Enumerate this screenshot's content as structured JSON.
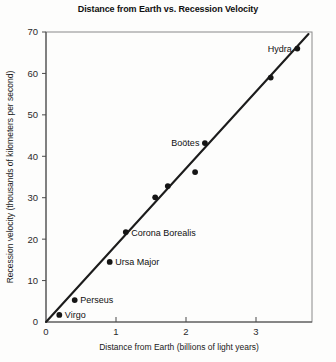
{
  "chart_data": {
    "type": "scatter",
    "title": "Distance from Earth vs. Recession Velocity",
    "xlabel": "Distance from Earth (billions of light years)",
    "ylabel": "Recession velocity (thousands of kilometers per second)",
    "xlim": [
      0,
      3.8
    ],
    "ylim": [
      0,
      70
    ],
    "xticks": [
      0,
      1,
      2,
      3
    ],
    "yticks": [
      0,
      10,
      20,
      30,
      40,
      50,
      60,
      70
    ],
    "xticklabels": [
      "0",
      "1",
      "2",
      "3"
    ],
    "yticklabels": [
      "0",
      "10",
      "20",
      "30",
      "40",
      "50",
      "60",
      "70"
    ],
    "grid": false,
    "legend": false,
    "points": [
      {
        "name": "Virgo",
        "x": 0.19,
        "y": 1.7,
        "label": "Virgo",
        "label_pos": "right"
      },
      {
        "name": "Perseus",
        "x": 0.41,
        "y": 5.3,
        "label": "Perseus",
        "label_pos": "right"
      },
      {
        "name": "Ursa Major",
        "x": 0.91,
        "y": 14.5,
        "label": "Ursa Major",
        "label_pos": "right"
      },
      {
        "name": "Corona Borealis",
        "x": 1.14,
        "y": 21.7,
        "label": "Corona Borealis",
        "label_pos": "right"
      },
      {
        "name": "unlabeled-1",
        "x": 1.56,
        "y": 30.1,
        "label": "",
        "label_pos": "none"
      },
      {
        "name": "unlabeled-2",
        "x": 1.74,
        "y": 32.8,
        "label": "",
        "label_pos": "none"
      },
      {
        "name": "unlabeled-3",
        "x": 2.13,
        "y": 36.2,
        "label": "",
        "label_pos": "none"
      },
      {
        "name": "Bootes",
        "x": 2.27,
        "y": 43.2,
        "label": "Boötes",
        "label_pos": "left"
      },
      {
        "name": "unlabeled-4",
        "x": 3.21,
        "y": 59.0,
        "label": "",
        "label_pos": "none"
      },
      {
        "name": "Hydra",
        "x": 3.59,
        "y": 66.0,
        "label": "Hydra",
        "label_pos": "left"
      }
    ],
    "trendline": {
      "x0": 0.0,
      "y0": 0.0,
      "x1": 3.75,
      "y1": 69.5
    },
    "series_color": "#151515",
    "line_color": "#1c1c1c"
  }
}
